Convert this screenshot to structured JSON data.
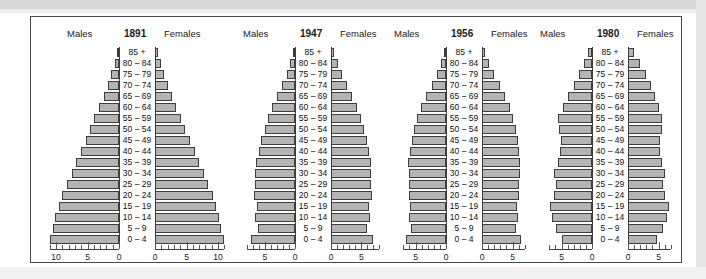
{
  "figure": {
    "type": "population-pyramid-panel",
    "panel_count": 4,
    "labels": {
      "males": "Males",
      "females": "Females"
    },
    "age_groups": [
      "85 +",
      "80 – 84",
      "75 – 79",
      "70 – 74",
      "65 – 69",
      "60 – 64",
      "55 – 59",
      "50 – 54",
      "45 – 49",
      "40 – 44",
      "35 – 39",
      "30 – 34",
      "25 – 29",
      "20 – 24",
      "15 – 19",
      "10 – 14",
      "5 – 9",
      "0 – 4"
    ],
    "colors": {
      "bar_fill": "#b4b4b4",
      "bar_stroke": "#3d3d3d",
      "axis": "#444444",
      "frame": "#4a4a4a",
      "text": "#1a1a1a"
    }
  },
  "chart_data": [
    {
      "type": "bar",
      "title": "1891",
      "subtitle": "",
      "xlabel": "",
      "ylabel": "",
      "orientation": "horizontal-mirrored",
      "categories": [
        "85 +",
        "80 – 84",
        "75 – 79",
        "70 – 74",
        "65 – 69",
        "60 – 64",
        "55 – 59",
        "50 – 54",
        "45 – 49",
        "40 – 44",
        "35 – 39",
        "30 – 34",
        "25 – 29",
        "20 – 24",
        "15 – 19",
        "10 – 14",
        "5 – 9",
        "0 – 4"
      ],
      "series": [
        {
          "name": "Males",
          "values": [
            0.3,
            0.7,
            1.2,
            1.8,
            2.4,
            3.2,
            3.9,
            4.6,
            5.3,
            6.1,
            6.9,
            7.5,
            8.2,
            9.0,
            9.6,
            10.1,
            10.4,
            10.9
          ]
        },
        {
          "name": "Females",
          "values": [
            0.4,
            0.9,
            1.4,
            2.0,
            2.7,
            3.4,
            4.1,
            4.8,
            5.5,
            6.3,
            7.0,
            7.7,
            8.4,
            9.2,
            9.7,
            10.1,
            10.4,
            10.9
          ]
        }
      ],
      "xlim": [
        0,
        11.5
      ],
      "ticks_major": [
        0,
        5,
        10
      ],
      "tick_labels": [
        "10",
        "5",
        "0",
        "0",
        "5",
        "10"
      ],
      "tick_step_minor": 1,
      "grid": false,
      "legend": "top"
    },
    {
      "type": "bar",
      "title": "1947",
      "subtitle": "",
      "xlabel": "",
      "ylabel": "",
      "orientation": "horizontal-mirrored",
      "categories": [
        "85 +",
        "80 – 84",
        "75 – 79",
        "70 – 74",
        "65 – 69",
        "60 – 64",
        "55 – 59",
        "50 – 54",
        "45 – 49",
        "40 – 44",
        "35 – 39",
        "30 – 34",
        "25 – 29",
        "20 – 24",
        "15 – 19",
        "10 – 14",
        "5 – 9",
        "0 – 4"
      ],
      "series": [
        {
          "name": "Males",
          "values": [
            0.3,
            0.8,
            1.4,
            2.2,
            3.0,
            3.8,
            4.4,
            5.0,
            5.6,
            6.0,
            6.5,
            6.6,
            6.6,
            6.7,
            6.3,
            6.6,
            6.1,
            7.2
          ]
        },
        {
          "name": "Females",
          "values": [
            0.5,
            1.1,
            1.8,
            2.7,
            3.5,
            4.3,
            4.9,
            5.4,
            5.9,
            6.2,
            6.6,
            6.6,
            6.6,
            6.7,
            6.2,
            6.5,
            6.0,
            7.0
          ]
        }
      ],
      "xlim": [
        0,
        8
      ],
      "ticks_major": [
        0,
        5
      ],
      "tick_labels": [
        "5",
        "0",
        "0",
        "5"
      ],
      "tick_step_minor": 1,
      "grid": false,
      "legend": "top"
    },
    {
      "type": "bar",
      "title": "1956",
      "subtitle": "",
      "xlabel": "",
      "ylabel": "",
      "orientation": "horizontal-mirrored",
      "categories": [
        "85 +",
        "80 – 84",
        "75 – 79",
        "70 – 74",
        "65 – 69",
        "60 – 64",
        "55 – 59",
        "50 – 54",
        "45 – 49",
        "40 – 44",
        "35 – 39",
        "30 – 34",
        "25 – 29",
        "20 – 24",
        "15 – 19",
        "10 – 14",
        "5 – 9",
        "0 – 4"
      ],
      "series": [
        {
          "name": "Males",
          "values": [
            0.3,
            0.8,
            1.5,
            2.3,
            3.2,
            4.1,
            4.7,
            5.2,
            5.6,
            5.9,
            6.2,
            6.1,
            6.0,
            6.0,
            5.9,
            6.0,
            5.7,
            6.5
          ]
        },
        {
          "name": "Females",
          "values": [
            0.5,
            1.1,
            1.9,
            2.9,
            3.8,
            4.6,
            5.1,
            5.5,
            5.9,
            6.1,
            6.3,
            6.2,
            6.1,
            6.0,
            5.8,
            5.9,
            5.6,
            6.4
          ]
        }
      ],
      "xlim": [
        0,
        7.5
      ],
      "ticks_major": [
        0,
        5
      ],
      "tick_labels": [
        "5",
        "0",
        "0",
        "5"
      ],
      "tick_step_minor": 1,
      "grid": false,
      "legend": "top"
    },
    {
      "type": "bar",
      "title": "1980",
      "subtitle": "",
      "xlabel": "",
      "ylabel": "",
      "orientation": "horizontal-mirrored",
      "categories": [
        "85 +",
        "80 – 84",
        "75 – 79",
        "70 – 74",
        "65 – 69",
        "60 – 64",
        "55 – 59",
        "50 – 54",
        "45 – 49",
        "40 – 44",
        "35 – 39",
        "30 – 34",
        "25 – 29",
        "20 – 24",
        "15 – 19",
        "10 – 14",
        "5 – 9",
        "0 – 4"
      ],
      "series": [
        {
          "name": "Males",
          "values": [
            0.6,
            1.3,
            2.1,
            3.0,
            3.9,
            4.7,
            5.5,
            5.4,
            5.1,
            5.3,
            5.6,
            6.2,
            5.9,
            6.3,
            6.9,
            6.6,
            5.9,
            4.9
          ]
        },
        {
          "name": "Females",
          "values": [
            1.0,
            1.9,
            2.9,
            3.7,
            4.4,
            5.0,
            5.6,
            5.5,
            5.2,
            5.3,
            5.6,
            6.1,
            5.8,
            6.1,
            6.7,
            6.4,
            5.7,
            4.8
          ]
        }
      ],
      "xlim": [
        0,
        7.5
      ],
      "ticks_major": [
        0,
        5
      ],
      "tick_labels": [
        "5",
        "0",
        "0",
        "5"
      ],
      "tick_step_minor": 1,
      "grid": false,
      "legend": "top"
    }
  ],
  "layout": {
    "panels": [
      {
        "left": 8,
        "width": 196,
        "axis_px_per_unit": 6.3,
        "label_col_w": 36,
        "gap": 0,
        "max_ticks": 11
      },
      {
        "left": 206,
        "width": 152,
        "axis_px_per_unit": 6.05,
        "label_col_w": 36,
        "gap": 0,
        "max_ticks": 8
      },
      {
        "left": 360,
        "width": 146,
        "axis_px_per_unit": 6.1,
        "label_col_w": 36,
        "gap": 0,
        "max_ticks": 7
      },
      {
        "left": 506,
        "width": 146,
        "axis_px_per_unit": 6.1,
        "label_col_w": 36,
        "gap": 0,
        "max_ticks": 7
      }
    ]
  }
}
